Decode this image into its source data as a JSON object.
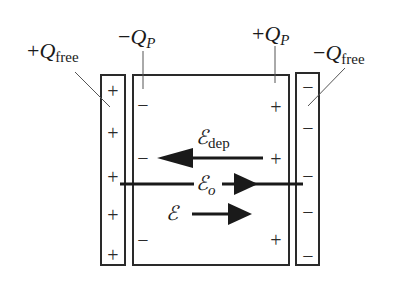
{
  "diagram": {
    "colors": {
      "stroke": "#2a2a2a",
      "background": "#ffffff"
    },
    "labels": {
      "plus_q_free": {
        "sign": "+",
        "symbol": "Q",
        "sub": "free"
      },
      "minus_q_p": {
        "sign": "−",
        "symbol": "Q",
        "sub": "P"
      },
      "plus_q_p": {
        "sign": "+",
        "symbol": "Q",
        "sub": "P"
      },
      "minus_q_free": {
        "sign": "−",
        "symbol": "Q",
        "sub": "free"
      }
    },
    "fields": {
      "e_dep": {
        "symbol": "ℰ",
        "sub": "dep",
        "direction": "left"
      },
      "e_o": {
        "symbol": "ℰ",
        "sub": "o",
        "direction": "right"
      },
      "e": {
        "symbol": "ℰ",
        "sub": "",
        "direction": "right"
      }
    },
    "left_plate": {
      "charge": "+",
      "signs": [
        "+",
        "+",
        "+",
        "+",
        "+"
      ]
    },
    "right_plate": {
      "charge": "−",
      "signs": [
        "−",
        "−",
        "−",
        "−",
        "−"
      ]
    },
    "dielectric": {
      "left_surface_signs": [
        "−",
        "−",
        "−"
      ],
      "right_surface_signs": [
        "+",
        "+",
        "+"
      ]
    }
  }
}
